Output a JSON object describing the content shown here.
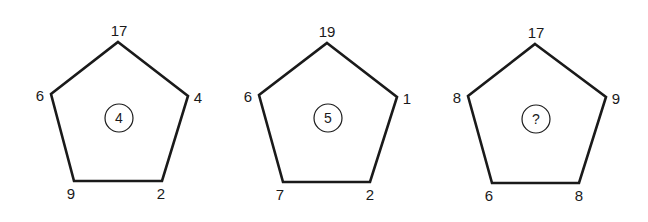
{
  "puzzle": {
    "pentagons": [
      {
        "top": "17",
        "left": "6",
        "right": "4",
        "bottom_left": "9",
        "bottom_right": "2",
        "center": "4",
        "pts": "118,42 188,96 162,181 74,181 51,94",
        "label_pos": {
          "top": [
            119,
            36
          ],
          "left": [
            40,
            101
          ],
          "right": [
            198,
            103
          ],
          "bottom_left": [
            71,
            199
          ],
          "bottom_right": [
            161,
            199
          ]
        },
        "circle": [
          119,
          118
        ]
      },
      {
        "top": "19",
        "left": "6",
        "right": "1",
        "bottom_left": "7",
        "bottom_right": "2",
        "center": "5",
        "pts": "327,43 397,97 370,182 283,182 259,95",
        "label_pos": {
          "top": [
            327,
            37
          ],
          "left": [
            248,
            102
          ],
          "right": [
            407,
            104
          ],
          "bottom_left": [
            280,
            200
          ],
          "bottom_right": [
            370,
            200
          ]
        },
        "circle": [
          328,
          118
        ]
      },
      {
        "top": "17",
        "left": "8",
        "right": "9",
        "bottom_left": "6",
        "bottom_right": "8",
        "center": "?",
        "pts": "535,44 606,97 579,183 492,183 468,96",
        "label_pos": {
          "top": [
            536,
            38
          ],
          "left": [
            457,
            103
          ],
          "right": [
            616,
            104
          ],
          "bottom_left": [
            489,
            201
          ],
          "bottom_right": [
            579,
            201
          ]
        },
        "circle": [
          536,
          119
        ]
      }
    ]
  }
}
